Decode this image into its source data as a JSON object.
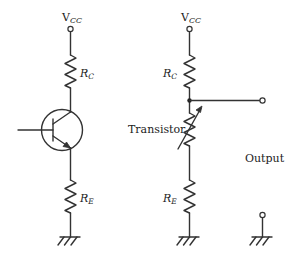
{
  "figure": {
    "type": "circuit-diagram"
  },
  "left_circuit": {
    "supply_label": "V",
    "supply_subscript": "CC",
    "collector_resistor": {
      "label": "R",
      "subscript": "C"
    },
    "emitter_resistor": {
      "label": "R",
      "subscript": "E"
    },
    "transistor_type": "NPN"
  },
  "right_circuit": {
    "supply_label": "V",
    "supply_subscript": "CC",
    "collector_resistor": {
      "label": "R",
      "subscript": "C"
    },
    "variable_resistor_label": "Transistor",
    "emitter_resistor": {
      "label": "R",
      "subscript": "E"
    },
    "output_label": "Output"
  },
  "colors": {
    "line": "#333333",
    "background": "#ffffff",
    "text": "#222222"
  }
}
